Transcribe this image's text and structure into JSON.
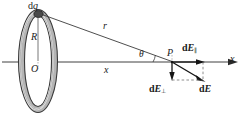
{
  "figure": {
    "name": "electric-field-of-charged-ring-on-axis",
    "background_color": "#ffffff",
    "stroke_color": "#1a1a1a",
    "ring_fill_color": "#b0b0b0",
    "ring_outline_color": "#3a3a3a",
    "width": 246,
    "height": 117
  },
  "labels": {
    "charge_element": "d",
    "charge_element_var": "q",
    "radius": "R",
    "center": "O",
    "distance_r": "r",
    "distance_x": "x",
    "angle_theta": "θ",
    "field_point": "P",
    "axis": "x",
    "field_total_d": "d",
    "field_total_E": "E",
    "field_parallel_d": "d",
    "field_parallel_E": "E",
    "field_parallel_sub": "∥",
    "field_perp_d": "d",
    "field_perp_E": "E",
    "field_perp_sub": "⊥"
  },
  "geometry": {
    "ring_center_x": 38,
    "ring_center_y": 61,
    "ring_rx": 20,
    "ring_ry": 52,
    "dq_x": 38,
    "dq_y": 13,
    "point_p_x": 172,
    "point_p_y": 62,
    "axis_y": 62,
    "axis_start_x": 2,
    "axis_end_x": 238,
    "theta_deg": 20,
    "dE_parallel_end_x": 204,
    "dE_perp_end_y": 80,
    "dE_end_x": 204,
    "dE_end_y": 80
  }
}
